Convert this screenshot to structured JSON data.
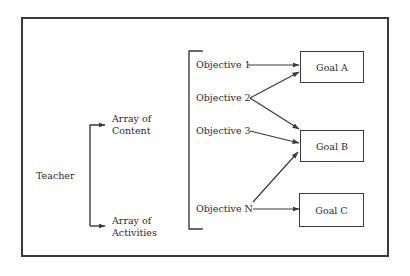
{
  "diagram": {
    "source_node": {
      "label": "Teacher"
    },
    "arrays": [
      {
        "line1": "Array of",
        "line2": "Content"
      },
      {
        "line1": "Array of",
        "line2": "Activities"
      }
    ],
    "objectives": [
      {
        "label": "Objective 1"
      },
      {
        "label": "Objective 2"
      },
      {
        "label": "Objective 3"
      },
      {
        "label": "Objective N"
      }
    ],
    "goals": [
      {
        "label": "Goal A"
      },
      {
        "label": "Goal B"
      },
      {
        "label": "Goal C"
      }
    ],
    "edges": [
      {
        "from": "Teacher",
        "to": "Array of Content"
      },
      {
        "from": "Teacher",
        "to": "Array of Activities"
      },
      {
        "from": "Objective 1",
        "to": "Goal A"
      },
      {
        "from": "Objective 2",
        "to": "Goal A"
      },
      {
        "from": "Objective 2",
        "to": "Goal B"
      },
      {
        "from": "Objective 3",
        "to": "Goal B"
      },
      {
        "from": "Objective N",
        "to": "Goal B"
      },
      {
        "from": "Objective N",
        "to": "Goal C"
      }
    ],
    "colors": {
      "line": "#3a3a3a",
      "text": "#2a2a2a",
      "background": "#ffffff"
    }
  }
}
